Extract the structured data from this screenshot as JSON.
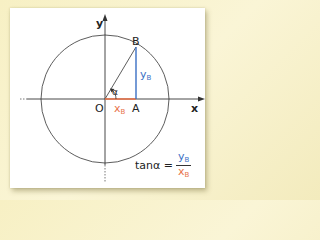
{
  "diagram": {
    "axis_labels": {
      "x": "x",
      "y": "y"
    },
    "points": {
      "origin": "O",
      "A": "A",
      "B": "B"
    },
    "angle_label": "α",
    "segments": {
      "yB": {
        "main": "y",
        "sub": "B",
        "color": "#3a6fc4"
      },
      "xB": {
        "main": "x",
        "sub": "B",
        "color": "#e8734a"
      }
    },
    "formula": {
      "lhs": "tanα =",
      "numerator": {
        "main": "y",
        "sub": "B"
      },
      "denominator": {
        "main": "x",
        "sub": "B"
      }
    },
    "colors": {
      "background": "#f7f0c4",
      "panel": "#ffffff",
      "axis": "#333333",
      "circle": "#333333",
      "blue_segment": "#3a6fc4",
      "orange_segment": "#e8734a"
    }
  }
}
